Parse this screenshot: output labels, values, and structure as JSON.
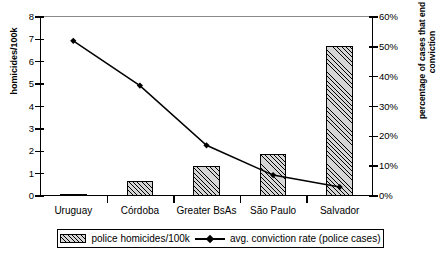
{
  "chart_data": {
    "type": "bar",
    "title": "",
    "categories": [
      "Uruguay",
      "Córdoba",
      "Greater BsAs",
      "São Paulo",
      "Salvador"
    ],
    "series": [
      {
        "name": "police homicides/100k",
        "type": "bar",
        "axis": "left",
        "values": [
          0.08,
          0.65,
          1.35,
          1.9,
          6.7
        ]
      },
      {
        "name": "avg. conviction rate (police cases)",
        "type": "line",
        "axis": "right",
        "values": [
          52,
          37,
          17,
          7,
          3
        ],
        "value_suffix": "%"
      }
    ],
    "xlabel": "",
    "ylabel": "homicides/100k",
    "ylabel_right": "percentage of cases that end in a conviction",
    "ylim": [
      0,
      8
    ],
    "ylim_right": [
      0,
      60
    ],
    "yticks": [
      "0",
      "1",
      "2",
      "3",
      "4",
      "5",
      "6",
      "7",
      "8"
    ],
    "yticks_right": [
      "0%",
      "10%",
      "20%",
      "30%",
      "40%",
      "50%",
      "60%"
    ],
    "grid": false,
    "legend_position": "bottom"
  },
  "axes": {
    "left_title": "homicides/100k",
    "right_title_line1": "percentage of cases that end in a",
    "right_title_line2": "conviction"
  },
  "legend": {
    "bar_label": "police homicides/100k",
    "line_label": "avg. conviction rate (police cases)"
  },
  "colors": {
    "bar_fill": "#d6d6d6",
    "bar_hatch": "#000000",
    "line": "#000000",
    "axis": "#000000",
    "top_border": "#8a8a8a"
  }
}
